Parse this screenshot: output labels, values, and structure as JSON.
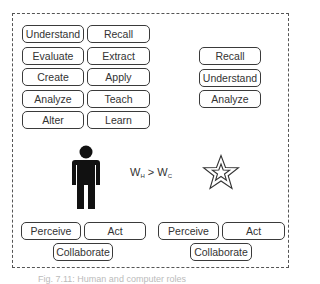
{
  "human_skills": [
    {
      "label": "Understand"
    },
    {
      "label": "Recall"
    },
    {
      "label": "Evaluate"
    },
    {
      "label": "Extract"
    },
    {
      "label": "Create"
    },
    {
      "label": "Apply"
    },
    {
      "label": "Analyze"
    },
    {
      "label": "Teach"
    },
    {
      "label": "Alter"
    },
    {
      "label": "Learn"
    }
  ],
  "computer_skills": [
    {
      "label": "Recall"
    },
    {
      "label": "Understand"
    },
    {
      "label": "Analyze"
    }
  ],
  "human_actions": {
    "perceive": "Perceive",
    "act": "Act",
    "collaborate": "Collaborate"
  },
  "computer_actions": {
    "perceive": "Perceive",
    "act": "Act",
    "collaborate": "Collaborate"
  },
  "formula": {
    "w": "W",
    "sub_h": "H",
    "op": " > ",
    "sub_c": "C"
  },
  "icons": {
    "human": "person-icon",
    "computer": "star-icon"
  },
  "caption": "Fig. 7.11: Human and computer roles"
}
